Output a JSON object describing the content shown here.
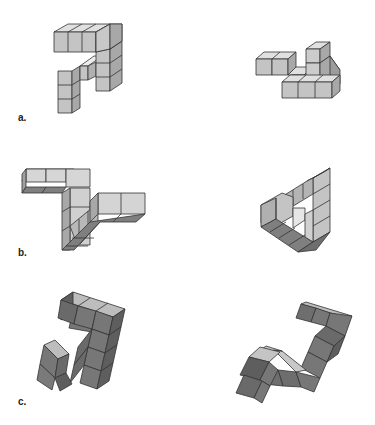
{
  "labels": {
    "a": "a.",
    "b": "b.",
    "c": "c."
  },
  "colors": {
    "light_top": "#e0e0e0",
    "light_front": "#c4c4c4",
    "light_side": "#a8a8a8",
    "dark_top": "#bdbdbd",
    "dark_front": "#777777",
    "dark_side": "#5e5e5e",
    "stroke": "#333333",
    "background": "#ffffff"
  },
  "figures": [
    {
      "id": "a-left",
      "row": "a",
      "position": "left",
      "shade": "light"
    },
    {
      "id": "a-right",
      "row": "a",
      "position": "right",
      "shade": "light"
    },
    {
      "id": "b-left",
      "row": "b",
      "position": "left",
      "shade": "light"
    },
    {
      "id": "b-right",
      "row": "b",
      "position": "right",
      "shade": "light"
    },
    {
      "id": "c-left",
      "row": "c",
      "position": "left",
      "shade": "dark"
    },
    {
      "id": "c-right",
      "row": "c",
      "position": "right",
      "shade": "dark"
    }
  ]
}
